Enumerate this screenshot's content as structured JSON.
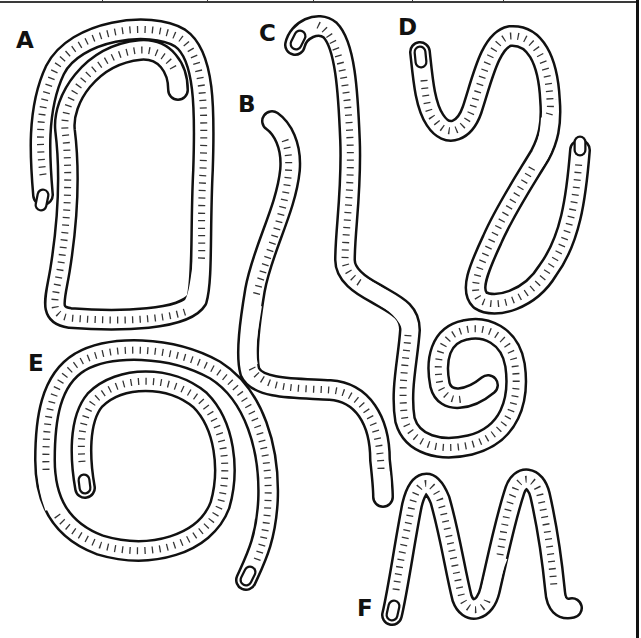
{
  "figure": {
    "title": "",
    "panels": [
      {
        "id": "A",
        "label": "A",
        "x": 16,
        "y": 29
      },
      {
        "id": "B",
        "label": "B",
        "x": 238,
        "y": 93
      },
      {
        "id": "C",
        "label": "C",
        "x": 259,
        "y": 22
      },
      {
        "id": "D",
        "label": "D",
        "x": 398,
        "y": 16
      },
      {
        "id": "E",
        "label": "E",
        "x": 28,
        "y": 352
      },
      {
        "id": "F",
        "label": "F",
        "x": 357,
        "y": 597
      }
    ],
    "colors": {
      "stroke": "#111111",
      "fill": "#ffffff",
      "border": "#3a3a3a"
    },
    "top_rule_dividers": [
      102,
      207,
      313,
      412,
      503
    ]
  }
}
